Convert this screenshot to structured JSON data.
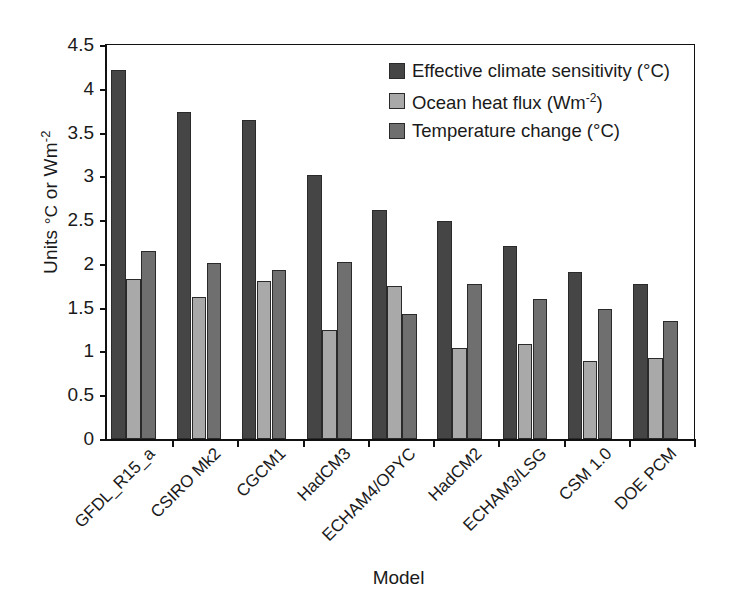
{
  "chart_data": {
    "type": "bar",
    "title": "",
    "xlabel": "Model",
    "ylabel": "Units °C or Wm-2",
    "ylim": [
      0,
      4.5
    ],
    "ytick_step": 0.5,
    "yticks": [
      "4.5",
      "4",
      "3.5",
      "3",
      "2.5",
      "2",
      "1.5",
      "1",
      "0.5",
      "0"
    ],
    "grid": false,
    "legend_position": "top-right",
    "categories": [
      "GFDL_R15_a",
      "CSIRO Mk2",
      "CGCM1",
      "HadCM3",
      "ECHAM4/OPYC",
      "HadCM2",
      "ECHAM3/LSG",
      "CSM 1.0",
      "DOE PCM"
    ],
    "series": [
      {
        "name": "Effective climate sensitivity (°C)",
        "unit": "°C",
        "color": "#454545",
        "values": [
          4.22,
          3.74,
          3.64,
          3.01,
          2.61,
          2.49,
          2.21,
          1.91,
          1.77
        ]
      },
      {
        "name": "Ocean heat flux (Wm-2)",
        "unit": "Wm-2",
        "color": "#a9a9a9",
        "values": [
          1.83,
          1.62,
          1.8,
          1.25,
          1.75,
          1.04,
          1.08,
          0.89,
          0.92
        ]
      },
      {
        "name": "Temperature change (°C)",
        "unit": "°C",
        "color": "#6f6f6f",
        "values": [
          2.15,
          2.01,
          1.93,
          2.02,
          1.43,
          1.77,
          1.6,
          1.48,
          1.35
        ]
      }
    ]
  },
  "axes": {
    "y_title_main": "Units ",
    "y_title_deg": "°C",
    "y_title_mid": " or Wm",
    "y_title_sup": "-2",
    "x_title": "Model"
  },
  "legend": {
    "items": [
      {
        "label_main": "Effective climate sensitivity (°C)",
        "swatch": "dark-swatch"
      },
      {
        "label_main": "Ocean heat flux (Wm",
        "label_sup": "-2",
        "label_tail": ")",
        "swatch": "light-swatch"
      },
      {
        "label_main": "Temperature change (°C)",
        "swatch": "medium-swatch"
      }
    ]
  }
}
